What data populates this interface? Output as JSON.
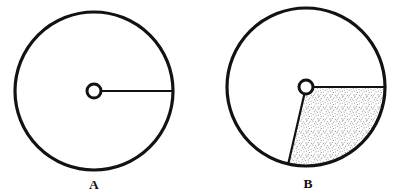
{
  "figure": {
    "background_color": "#ffffff",
    "ink_color": "#121212",
    "stipple_color": "#8a8a8a",
    "panels": [
      {
        "id": "panel-a",
        "label": "A",
        "label_x": 94,
        "label_y": 189,
        "center_x": 94,
        "center_y": 91,
        "radius": 79,
        "outline_width": 3.2,
        "hub_radius": 7,
        "hub_stroke_width": 3,
        "radial_line": {
          "from_angle_deg": 0,
          "to_radius": 79,
          "stroke_width": 2.2
        },
        "sector": null
      },
      {
        "id": "panel-b",
        "label": "B",
        "label_x": 308,
        "label_y": 188,
        "center_x": 306,
        "center_y": 87,
        "radius": 79,
        "outline_width": 3.2,
        "hub_radius": 7,
        "hub_stroke_width": 3,
        "radial_line": null,
        "sector": {
          "start_angle_deg": 0,
          "end_angle_deg": 103,
          "fill": "stipple",
          "edge_stroke_width": 2.2
        }
      }
    ]
  },
  "cropped_header_text": "",
  "page_title": "Figure A and B"
}
